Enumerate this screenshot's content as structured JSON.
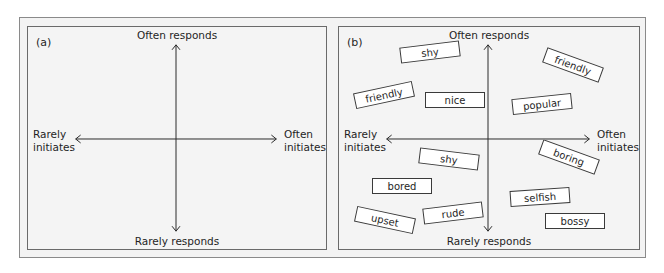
{
  "panels": {
    "a": {
      "label": "(a)",
      "axes": {
        "top": "Often responds",
        "bottom": "Rarely responds",
        "left_line1": "Rarely",
        "left_line2": "initiates",
        "right_line1": "Often",
        "right_line2": "initiates"
      }
    },
    "b": {
      "label": "(b)",
      "axes": {
        "top": "Often responds",
        "bottom": "Rarely responds",
        "left_line1": "Rarely",
        "left_line2": "initiates",
        "right_line1": "Often",
        "right_line2": "initiates"
      },
      "tags": [
        {
          "text": "shy",
          "x": 61,
          "y": 17,
          "w": 60,
          "rot": -7
        },
        {
          "text": "friendly",
          "x": 204,
          "y": 30,
          "w": 60,
          "rot": 20
        },
        {
          "text": "friendly",
          "x": 15,
          "y": 60,
          "w": 60,
          "rot": -12
        },
        {
          "text": "nice",
          "x": 86,
          "y": 65,
          "w": 60,
          "rot": 0
        },
        {
          "text": "popular",
          "x": 173,
          "y": 69,
          "w": 60,
          "rot": -6
        },
        {
          "text": "shy",
          "x": 80,
          "y": 124,
          "w": 60,
          "rot": 7
        },
        {
          "text": "boring",
          "x": 200,
          "y": 122,
          "w": 60,
          "rot": 20
        },
        {
          "text": "bored",
          "x": 33,
          "y": 151,
          "w": 60,
          "rot": 0
        },
        {
          "text": "selfish",
          "x": 171,
          "y": 162,
          "w": 60,
          "rot": -4
        },
        {
          "text": "upset",
          "x": 16,
          "y": 185,
          "w": 60,
          "rot": 12
        },
        {
          "text": "rude",
          "x": 84,
          "y": 178,
          "w": 60,
          "rot": -7
        },
        {
          "text": "bossy",
          "x": 206,
          "y": 186,
          "w": 60,
          "rot": 0
        }
      ]
    }
  },
  "colors": {
    "frame": "#8a8a8a",
    "panel_border": "#6a6a6a",
    "background": "#f4f4f4",
    "ink": "#1f1f1f"
  }
}
